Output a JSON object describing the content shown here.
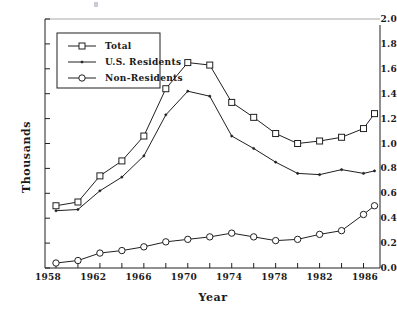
{
  "chart_data": {
    "type": "line",
    "title": "",
    "xlabel": "Year",
    "ylabel": "Thousands",
    "xlim": [
      1957,
      1987.5
    ],
    "ylim": [
      0.0,
      2.0
    ],
    "grid": false,
    "legend_position": "upper-left-inside",
    "x": [
      1958,
      1960,
      1962,
      1964,
      1966,
      1968,
      1970,
      1972,
      1974,
      1976,
      1978,
      1980,
      1982,
      1984,
      1986,
      1987
    ],
    "xticks": [
      1958,
      1960,
      1962,
      1964,
      1966,
      1968,
      1970,
      1972,
      1974,
      1976,
      1978,
      1980,
      1982,
      1984,
      1986
    ],
    "xtick_labels": [
      "1958",
      "",
      "1962",
      "",
      "1966",
      "",
      "1970",
      "",
      "1974",
      "",
      "1978",
      "",
      "1982",
      "",
      "1986"
    ],
    "xtick_labels_shown": [
      "1958",
      "1962",
      "1966",
      "1970",
      "1974",
      "1978",
      "1982",
      "1986"
    ],
    "yticks": [
      0.0,
      0.2,
      0.4,
      0.6,
      0.8,
      1.0,
      1.2,
      1.4,
      1.6,
      1.8,
      2.0
    ],
    "ytick_labels": [
      "0.0",
      "0.2",
      "0.4",
      "0.6",
      "0.8",
      "1.0",
      "1.2",
      "1.4",
      "1.6",
      "1.8",
      "2.0"
    ],
    "series": [
      {
        "name": "Total",
        "marker": "square",
        "values": [
          0.5,
          0.53,
          0.74,
          0.86,
          1.06,
          1.44,
          1.65,
          1.63,
          1.33,
          1.21,
          1.08,
          1.0,
          1.02,
          1.05,
          1.12,
          1.24
        ]
      },
      {
        "name": "U.S. Residents",
        "marker": "plus",
        "values": [
          0.46,
          0.47,
          0.62,
          0.73,
          0.9,
          1.23,
          1.42,
          1.38,
          1.06,
          0.96,
          0.85,
          0.76,
          0.75,
          0.79,
          0.76,
          0.78
        ]
      },
      {
        "name": "Non-Residents",
        "marker": "circle",
        "values": [
          0.04,
          0.06,
          0.12,
          0.14,
          0.17,
          0.21,
          0.23,
          0.25,
          0.28,
          0.25,
          0.22,
          0.23,
          0.27,
          0.3,
          0.43,
          0.5
        ]
      }
    ]
  },
  "legend": {
    "entries": [
      {
        "label": "Total"
      },
      {
        "label": "U.S. Residents"
      },
      {
        "label": "Non-Residents"
      }
    ]
  }
}
